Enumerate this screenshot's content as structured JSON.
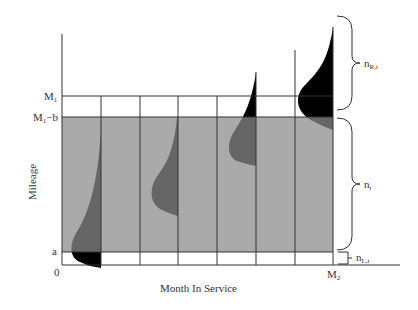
{
  "diagram": {
    "x_axis_label": "Month In Service",
    "y_axis_label": "Mileage",
    "y_ticks": {
      "m1": "M",
      "m1_sub": "1",
      "m1_minus_b": "M",
      "m1_minus_b_sub": "1",
      "m1_minus_b_suffix": "−b",
      "a": "a",
      "zero": "0"
    },
    "x_ticks": {
      "m2": "M",
      "m2_sub": "2"
    },
    "braces": {
      "right_censored": "n",
      "right_censored_sub": "R,t",
      "observed": "n",
      "observed_sub": "t",
      "left_censored": "n",
      "left_censored_sub": "L,t"
    },
    "colors": {
      "observed_region": "#aaaaaa",
      "distribution_inside": "#666666",
      "distribution_outside": "#000000",
      "lines": "#333333"
    }
  }
}
